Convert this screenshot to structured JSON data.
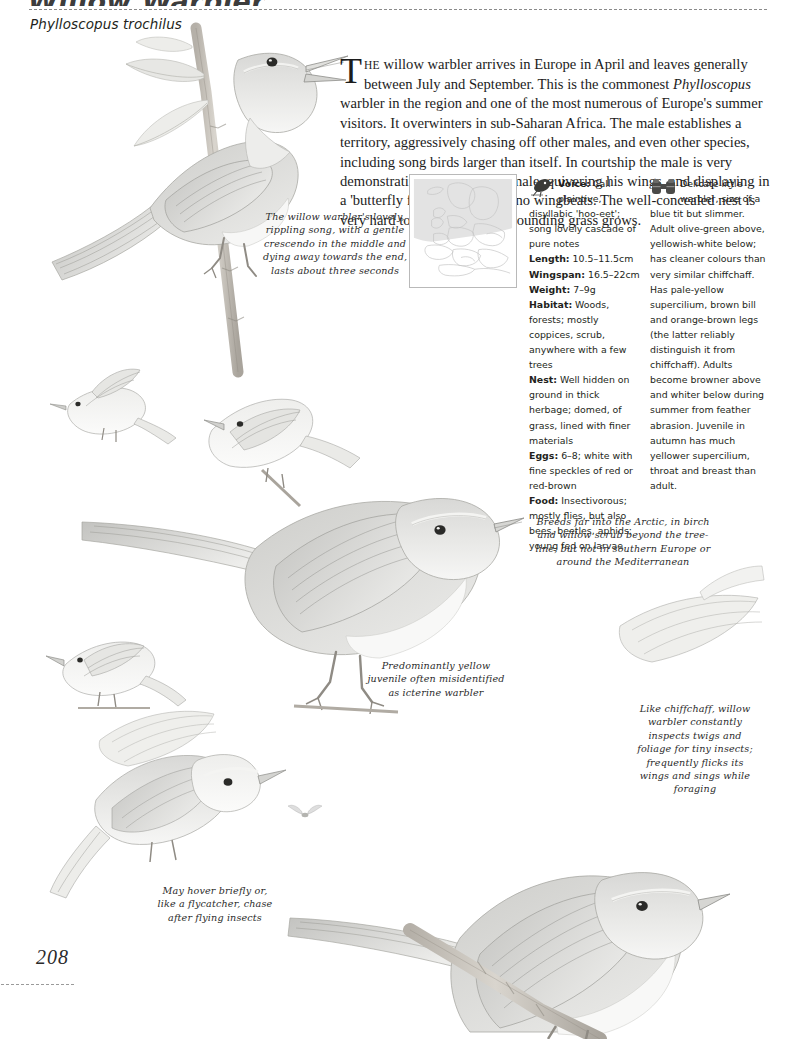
{
  "header": {
    "title": "Willow Warbler",
    "scientific_name": "Phylloscopus trochilus"
  },
  "intro": {
    "dropcap": "T",
    "smallcaps": "HE",
    "text_part1": " willow warbler arrives in Europe in April and leaves generally between July and September. This is the commonest ",
    "italic_genus": "Phylloscopus",
    "text_part2": " warbler in the region and one of the most numerous of Europe's summer visitors. It overwinters in sub-Saharan Africa. The male establishes a territory, aggressively chasing off other males, and even other species, including song birds larger than itself. In courtship the male is very demonstrative, chasing the female, quivering his wings, and displaying in a 'butterfly flight' with few or no wingbeats. The well-concealed nest is very hard to find once the surrounding grass grows."
  },
  "map": {
    "icon": "europe-distribution-map",
    "range_shading": "#e3e3e3",
    "outline_color": "#c4c4c4"
  },
  "facts": {
    "icon": "singing-bird-icon",
    "entries": [
      {
        "label": "Voice:",
        "value": " Call plaintive, disyllabic 'hoo-eet'; song lovely cascade of pure notes"
      },
      {
        "label": "Length:",
        "value": " 10.5–11.5cm"
      },
      {
        "label": "Wingspan:",
        "value": " 16.5–22cm"
      },
      {
        "label": "Weight:",
        "value": " 7–9g"
      },
      {
        "label": "Habitat:",
        "value": " Woods, forests; mostly coppices, scrub, anywhere with a few trees"
      },
      {
        "label": "Nest:",
        "value": " Well hidden on ground in thick herbage; domed, of grass, lined with finer materials"
      },
      {
        "label": "Eggs:",
        "value": " 6–8; white with fine speckles of red or red-brown"
      },
      {
        "label": "Food:",
        "value": " Insectivorous; mostly flies, but also bees, beetles, aphids; young fed on larvae"
      }
    ]
  },
  "description": {
    "icon": "binoculars-icon",
    "text": "Delicate little warbler, size of a blue tit but slimmer. Adult olive-green above, yellowish-white below; has cleaner colours than very similar chiffchaff. Has pale-yellow supercilium, brown bill and orange-brown legs (the latter reliably distinguish it from chiffchaff). Adults become browner above and whiter below during summer from feather abrasion. Juvenile in autumn has much yellower supercilium, throat and breast than adult."
  },
  "captions": {
    "song": "The willow warbler's lovely, rippling song, with a gentle crescendo in the middle and dying away towards the end, lasts about three seconds",
    "arctic": "Breeds far into the Arctic, in birch and willow scrub beyond the tree-line, but not in southern Europe or around the Mediterranean",
    "juvenile": "Predominantly yellow juvenile often misidentified as icterine warbler",
    "hover": "May hover briefly or, like a flycatcher, chase after flying insects",
    "chiffchaff": "Like chiffchaff, willow warbler constantly inspects twigs and foliage for tiny insects; frequently flicks its wings and sings while foraging"
  },
  "illustrations": [
    {
      "name": "warbler-perched-on-willow-branch-main",
      "position": "top-left"
    },
    {
      "name": "warbler-small-flying-left",
      "position": "mid-left"
    },
    {
      "name": "warbler-small-perched-pair",
      "position": "mid-left-lower"
    },
    {
      "name": "warbler-perched-large-centre",
      "position": "centre"
    },
    {
      "name": "warbler-juvenile-small-left",
      "position": "left-lower"
    },
    {
      "name": "warbler-hovering-left",
      "position": "bottom-left"
    },
    {
      "name": "warbler-wing-detail-upper-right",
      "position": "right"
    },
    {
      "name": "warbler-perched-large-bottom-right",
      "position": "bottom-right"
    },
    {
      "name": "insect-small",
      "position": "centre-lower"
    }
  ],
  "footer": {
    "page_number": "208"
  }
}
